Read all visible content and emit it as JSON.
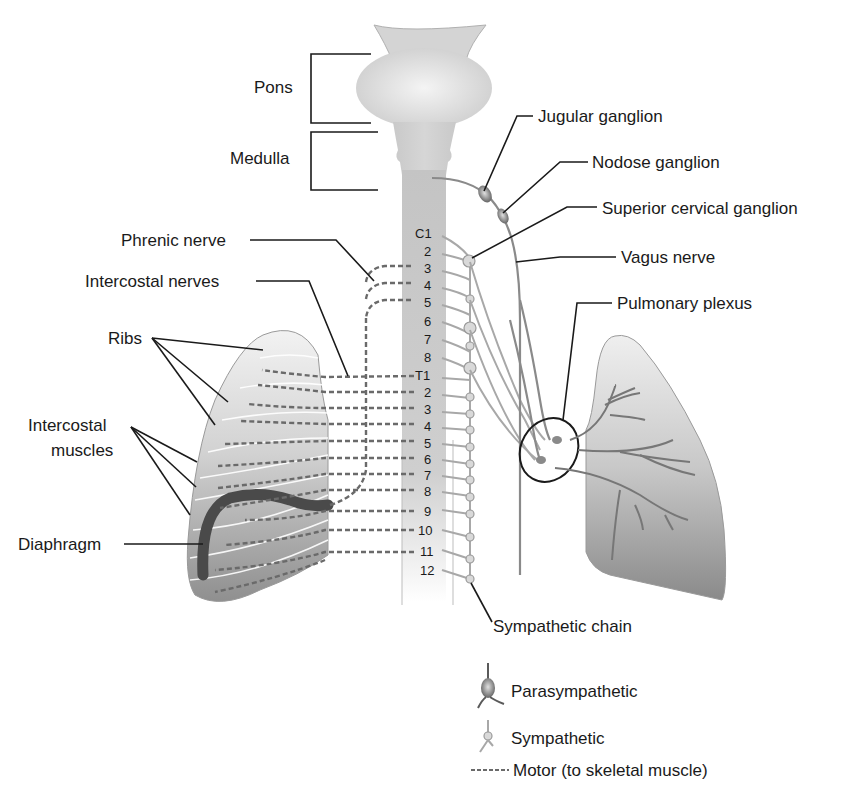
{
  "diagram": {
    "labels": {
      "pons": "Pons",
      "medulla": "Medulla",
      "jugular_ganglion": "Jugular ganglion",
      "nodose_ganglion": "Nodose ganglion",
      "superior_cervical_ganglion": "Superior cervical ganglion",
      "vagus_nerve": "Vagus nerve",
      "phrenic_nerve": "Phrenic nerve",
      "intercostal_nerves": "Intercostal nerves",
      "ribs": "Ribs",
      "intercostal_muscles_line1": "Intercostal",
      "intercostal_muscles_line2": "muscles",
      "pulmonary_plexus": "Pulmonary plexus",
      "diaphragm": "Diaphragm",
      "sympathetic_chain": "Sympathetic chain"
    },
    "spinal_levels": [
      "C1",
      "2",
      "3",
      "4",
      "5",
      "6",
      "7",
      "8",
      "T1",
      "2",
      "3",
      "4",
      "5",
      "6",
      "7",
      "8",
      "9",
      "10",
      "11",
      "12"
    ],
    "legend": {
      "parasympathetic": "Parasympathetic",
      "sympathetic": "Sympathetic",
      "motor": "Motor (to skeletal muscle)",
      "motor_dash": "-----"
    }
  }
}
